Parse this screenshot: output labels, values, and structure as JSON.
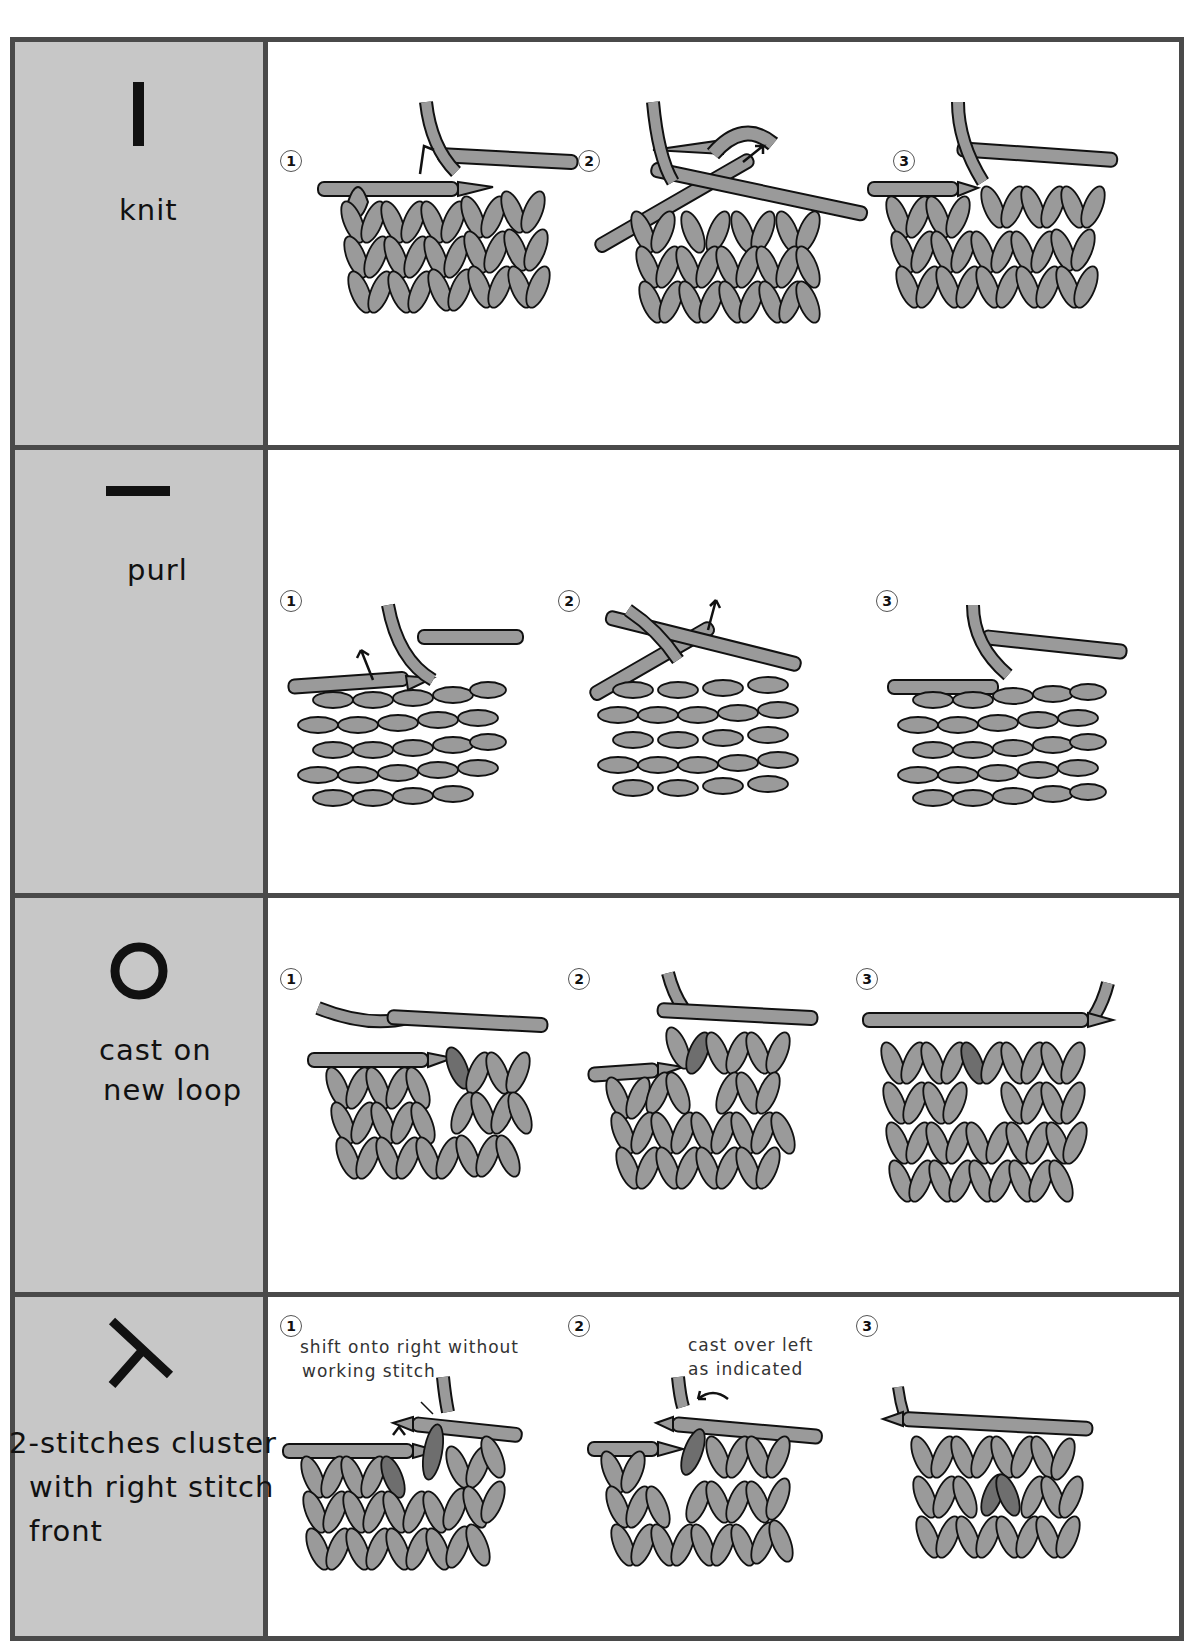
{
  "page": {
    "colors": {
      "border": "#4a4a4a",
      "label_background": "#c7c7c7",
      "yarn": "#9a9a9a",
      "yarn_highlight": "#6e6e6e",
      "outline": "#111111",
      "panel_background": "#ffffff"
    }
  },
  "rows": [
    {
      "id": "knit",
      "symbol": "vertical-bar",
      "label": "knit",
      "steps": [
        {
          "number": "1",
          "note": ""
        },
        {
          "number": "2",
          "note": ""
        },
        {
          "number": "3",
          "note": ""
        }
      ]
    },
    {
      "id": "purl",
      "symbol": "horizontal-bar",
      "label": "purl",
      "steps": [
        {
          "number": "1",
          "note": ""
        },
        {
          "number": "2",
          "note": ""
        },
        {
          "number": "3",
          "note": ""
        }
      ]
    },
    {
      "id": "cast-on-new-loop",
      "symbol": "circle",
      "label_line1": "cast on",
      "label_line2": "new loop",
      "steps": [
        {
          "number": "1",
          "note": ""
        },
        {
          "number": "2",
          "note": ""
        },
        {
          "number": "3",
          "note": ""
        }
      ]
    },
    {
      "id": "2-stitches-cluster-right-front",
      "symbol": "lambda-right-front",
      "label_line1": "2-stitches cluster",
      "label_line2": "with right stitch",
      "label_line3": "front",
      "steps": [
        {
          "number": "1",
          "note_line1": "shift onto right without",
          "note_line2": "working stitch"
        },
        {
          "number": "2",
          "note_line1": "cast over left",
          "note_line2": "as indicated"
        },
        {
          "number": "3",
          "note": ""
        }
      ]
    }
  ]
}
